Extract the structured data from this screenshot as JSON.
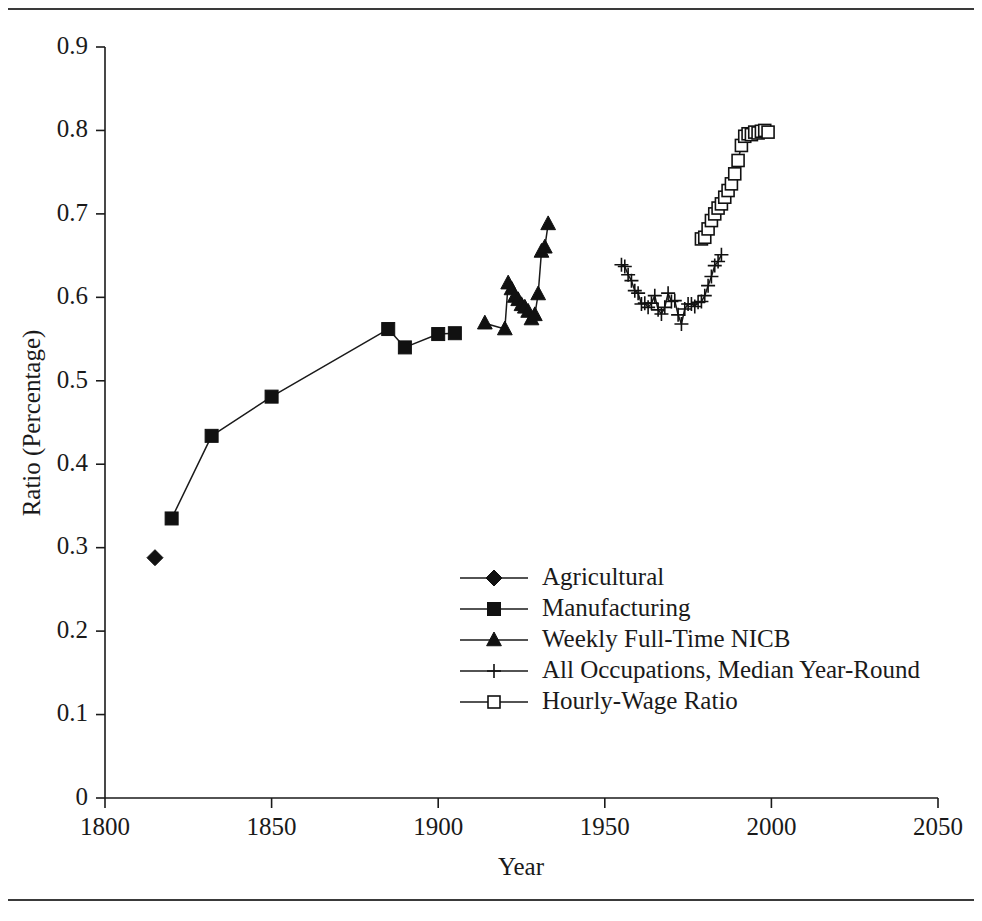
{
  "figure": {
    "background": "#ffffff",
    "ink_color": "#1a1a1a",
    "rule_top": "horizontal-rule",
    "rule_bottom": "horizontal-rule"
  },
  "chart_data": {
    "type": "line",
    "title": "",
    "subtitle": "",
    "xlabel": "Year",
    "ylabel": "Ratio (Percentage)",
    "xlim": [
      1800,
      2050
    ],
    "ylim": [
      0,
      0.9
    ],
    "xticks": [
      1800,
      1850,
      1900,
      1950,
      2000,
      2050
    ],
    "xticklabels": [
      "1800",
      "1850",
      "1900",
      "1950",
      "2000",
      "2050"
    ],
    "yticks": [
      0,
      0.1,
      0.2,
      0.3,
      0.4,
      0.5,
      0.6,
      0.7,
      0.8,
      0.9
    ],
    "yticklabels": [
      "0",
      "0.1",
      "0.2",
      "0.3",
      "0.4",
      "0.5",
      "0.6",
      "0.7",
      "0.8",
      "0.9"
    ],
    "grid": false,
    "legend_position": "center",
    "annotations": [],
    "series": [
      {
        "name": "Agricultural",
        "marker": "filled-diamond",
        "x": [
          1815
        ],
        "y": [
          0.288
        ]
      },
      {
        "name": "Manufacturing",
        "marker": "filled-square",
        "x": [
          1820,
          1832,
          1850,
          1885,
          1890,
          1900,
          1905
        ],
        "y": [
          0.335,
          0.434,
          0.481,
          0.562,
          0.54,
          0.556,
          0.557
        ]
      },
      {
        "name": "Weekly Full-Time NICB",
        "marker": "filled-triangle",
        "x": [
          1914,
          1920,
          1921,
          1922,
          1923,
          1924,
          1925,
          1926,
          1927,
          1928,
          1929,
          1930,
          1931,
          1932,
          1933
        ],
        "y": [
          0.569,
          0.562,
          0.617,
          0.61,
          0.601,
          0.597,
          0.591,
          0.588,
          0.583,
          0.574,
          0.579,
          0.604,
          0.655,
          0.66,
          0.688
        ]
      },
      {
        "name": "All Occupations, Median Year-Round",
        "marker": "plus",
        "x": [
          1955,
          1956,
          1957,
          1958,
          1959,
          1960,
          1961,
          1962,
          1963,
          1964,
          1965,
          1966,
          1967,
          1968,
          1969,
          1970,
          1971,
          1972,
          1973,
          1974,
          1975,
          1976,
          1977,
          1978,
          1979,
          1980,
          1981,
          1982,
          1983,
          1984,
          1985
        ],
        "y": [
          0.639,
          0.637,
          0.627,
          0.62,
          0.608,
          0.605,
          0.592,
          0.593,
          0.588,
          0.593,
          0.602,
          0.585,
          0.58,
          0.588,
          0.605,
          0.595,
          0.596,
          0.579,
          0.568,
          0.586,
          0.592,
          0.592,
          0.589,
          0.594,
          0.595,
          0.602,
          0.614,
          0.625,
          0.638,
          0.643,
          0.651
        ]
      },
      {
        "name": "Hourly-Wage Ratio",
        "marker": "open-square",
        "x": [
          1979,
          1980,
          1981,
          1982,
          1983,
          1984,
          1985,
          1986,
          1987,
          1988,
          1989,
          1990,
          1991,
          1992,
          1993,
          1994,
          1995,
          1996,
          1997,
          1998,
          1999
        ],
        "y": [
          0.67,
          0.672,
          0.682,
          0.692,
          0.7,
          0.707,
          0.712,
          0.72,
          0.728,
          0.736,
          0.748,
          0.764,
          0.782,
          0.793,
          0.796,
          0.795,
          0.798,
          0.797,
          0.799,
          0.8,
          0.798
        ]
      }
    ]
  },
  "legend": {
    "items": [
      {
        "label": "Agricultural",
        "marker": "filled-diamond"
      },
      {
        "label": "Manufacturing",
        "marker": "filled-square"
      },
      {
        "label": "Weekly Full-Time NICB",
        "marker": "filled-triangle"
      },
      {
        "label": "All Occupations, Median Year-Round",
        "marker": "plus"
      },
      {
        "label": "Hourly-Wage Ratio",
        "marker": "open-square"
      }
    ]
  }
}
